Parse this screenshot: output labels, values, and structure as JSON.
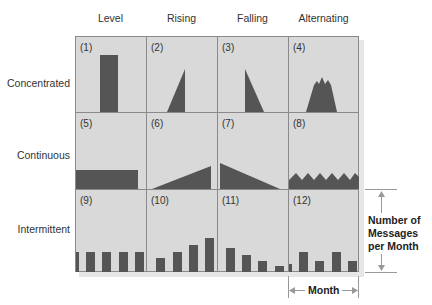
{
  "columns": [
    {
      "label": "Level"
    },
    {
      "label": "Rising"
    },
    {
      "label": "Falling"
    },
    {
      "label": "Alternating"
    }
  ],
  "rows": [
    {
      "label": "Concentrated"
    },
    {
      "label": "Continuous"
    },
    {
      "label": "Intermittent"
    }
  ],
  "cells": [
    {
      "num": "(1)",
      "pattern": "level-concentrated"
    },
    {
      "num": "(2)",
      "pattern": "rising-concentrated"
    },
    {
      "num": "(3)",
      "pattern": "falling-concentrated"
    },
    {
      "num": "(4)",
      "pattern": "alternating-concentrated"
    },
    {
      "num": "(5)",
      "pattern": "level-continuous"
    },
    {
      "num": "(6)",
      "pattern": "rising-continuous"
    },
    {
      "num": "(7)",
      "pattern": "falling-continuous"
    },
    {
      "num": "(8)",
      "pattern": "alternating-continuous"
    },
    {
      "num": "(9)",
      "pattern": "level-intermittent"
    },
    {
      "num": "(10)",
      "pattern": "rising-intermittent"
    },
    {
      "num": "(11)",
      "pattern": "falling-intermittent"
    },
    {
      "num": "(12)",
      "pattern": "alternating-intermittent"
    }
  ],
  "y_axis_annotation": {
    "line1": "Number of",
    "line2": "Messages",
    "line3": "per Month"
  },
  "x_axis_annotation": {
    "label": "Month"
  },
  "colors": {
    "cell_background": "#d9d9d9",
    "grid_line": "#8a8a8a",
    "shape_fill": "#555555"
  }
}
